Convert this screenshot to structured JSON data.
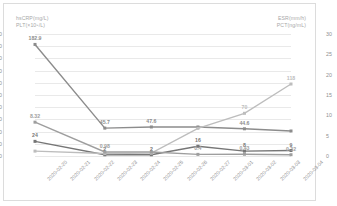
{
  "axes": {
    "left_title_1": "hsCRP(mg/L)",
    "left_title_2": "PLT(×10⁹/L)",
    "right_title_1": "ESR(mm/h)",
    "right_title_2": "PCT(ng/mL)"
  },
  "chart_data": {
    "type": "line",
    "title": "",
    "xlabel": "",
    "ylabel": "hsCRP(mg/L) / PLT(×10⁹/L)",
    "y2label": "ESR(mm/h) / PCT(ng/mL)",
    "ylim": [
      0,
      200
    ],
    "y2lim": [
      0,
      30
    ],
    "grid": true,
    "legend": "none",
    "left_ticks": [
      "0",
      "20",
      "40",
      "60",
      "80",
      "100",
      "120",
      "140",
      "160",
      "180",
      "200"
    ],
    "right_ticks": [
      "0",
      "5",
      "10",
      "15",
      "20",
      "25",
      "30"
    ],
    "categories": [
      "2020-02-20",
      "2020-02-21",
      "2020-02-22",
      "2020-02-23",
      "2020-02-24",
      "2020-02-25",
      "2020-02-26",
      "2020-02-27",
      "2020-03-01",
      "2020-03-02",
      "2020-03-03",
      "2020-03-04"
    ],
    "series": [
      {
        "name": "PLT(×10⁹/L)",
        "axis": "left",
        "color": "#8c8c8c",
        "x": [
          0,
          3,
          5,
          7,
          9,
          11
        ],
        "values": [
          182.9,
          45.7,
          47.6,
          47.6,
          44.6,
          41.0
        ],
        "labels": [
          "182.9",
          "45.7",
          "47.6",
          "",
          "44.6",
          ""
        ]
      },
      {
        "name": "hsCRP(mg/L)",
        "axis": "left",
        "color": "#767676",
        "x": [
          0,
          3,
          5,
          7,
          9,
          11
        ],
        "values": [
          24,
          2,
          2,
          16,
          8,
          9
        ],
        "labels": [
          "24",
          "2",
          "2",
          "16",
          "8",
          "9"
        ]
      },
      {
        "name": "ESR(mm/h)",
        "axis": "right",
        "color": "#bdbdbd",
        "x": [
          0,
          3,
          5,
          7,
          9,
          11
        ],
        "values": [
          1.2,
          0.6,
          0.7,
          6.8,
          10.5,
          17.7
        ],
        "labels": [
          "",
          "",
          "",
          "",
          "70",
          "118"
        ]
      },
      {
        "name": "PCT(ng/mL)",
        "axis": "right",
        "color": "#9e9e9e",
        "x": [
          0,
          3,
          5,
          7,
          9,
          11
        ],
        "values": [
          8.32,
          0.98,
          0.98,
          0.4,
          0.43,
          0.32
        ],
        "labels": [
          "8.32",
          "0.98",
          "",
          "0.4",
          "0.43",
          "0.32"
        ]
      }
    ],
    "annotations": [
      {
        "text": "182.9",
        "x": 0,
        "value": 182.9,
        "axis": "left"
      },
      {
        "text": "24",
        "x": 0,
        "value": 24,
        "axis": "left"
      },
      {
        "text": "8.32",
        "x": 0,
        "value": 8.32,
        "axis": "right"
      },
      {
        "text": "45.7",
        "x": 3,
        "value": 45.7,
        "axis": "left"
      },
      {
        "text": "2",
        "x": 3,
        "value": 2,
        "axis": "left"
      },
      {
        "text": "0.98",
        "x": 3,
        "value": 0.98,
        "axis": "right"
      },
      {
        "text": "47.6",
        "x": 5,
        "value": 47.6,
        "axis": "left"
      },
      {
        "text": "2",
        "x": 5,
        "value": 2,
        "axis": "left"
      },
      {
        "text": "16",
        "x": 5,
        "value": 16,
        "axis": "left"
      },
      {
        "text": "0.4",
        "x": 7,
        "value": 0.4,
        "axis": "right"
      },
      {
        "text": "70",
        "x": 9,
        "value": 70,
        "axis": "left"
      },
      {
        "text": "44.6",
        "x": 9,
        "value": 44.6,
        "axis": "left"
      },
      {
        "text": "8",
        "x": 9,
        "value": 8,
        "axis": "left"
      },
      {
        "text": "0.43",
        "x": 9,
        "value": 0.43,
        "axis": "right"
      },
      {
        "text": "118",
        "x": 11,
        "value": 118,
        "axis": "left"
      },
      {
        "text": "9",
        "x": 11,
        "value": 9,
        "axis": "left"
      },
      {
        "text": "32",
        "x": 11,
        "value": 32,
        "axis": "left"
      },
      {
        "text": "0.32",
        "x": 11,
        "value": 0.32,
        "axis": "right"
      }
    ]
  }
}
